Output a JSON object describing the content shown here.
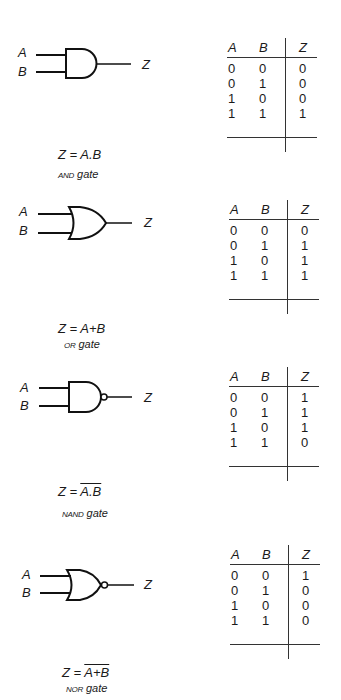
{
  "gates": [
    {
      "type": "AND",
      "inputs": [
        "A",
        "B"
      ],
      "output": "Z",
      "expression": {
        "prefix": "Z = ",
        "body": "A.B",
        "overline": false
      },
      "name": {
        "abbr": "AND",
        "suffix": "gate"
      },
      "truth_table": {
        "headers": [
          "A",
          "B",
          "Z"
        ],
        "rows": [
          [
            "0",
            "0",
            "0"
          ],
          [
            "0",
            "1",
            "0"
          ],
          [
            "1",
            "0",
            "0"
          ],
          [
            "1",
            "1",
            "1"
          ]
        ]
      }
    },
    {
      "type": "OR",
      "inputs": [
        "A",
        "B"
      ],
      "output": "Z",
      "expression": {
        "prefix": "Z = ",
        "body": "A+B",
        "overline": false
      },
      "name": {
        "abbr": "OR",
        "suffix": "gate"
      },
      "truth_table": {
        "headers": [
          "A",
          "B",
          "Z"
        ],
        "rows": [
          [
            "0",
            "0",
            "0"
          ],
          [
            "0",
            "1",
            "1"
          ],
          [
            "1",
            "0",
            "1"
          ],
          [
            "1",
            "1",
            "1"
          ]
        ]
      }
    },
    {
      "type": "NAND",
      "inputs": [
        "A",
        "B"
      ],
      "output": "Z",
      "expression": {
        "prefix": "Z = ",
        "body": "A.B",
        "overline": true
      },
      "name": {
        "abbr": "NAND",
        "suffix": "gate"
      },
      "truth_table": {
        "headers": [
          "A",
          "B",
          "Z"
        ],
        "rows": [
          [
            "0",
            "0",
            "1"
          ],
          [
            "0",
            "1",
            "1"
          ],
          [
            "1",
            "0",
            "1"
          ],
          [
            "1",
            "1",
            "0"
          ]
        ]
      }
    },
    {
      "type": "NOR",
      "inputs": [
        "A",
        "B"
      ],
      "output": "Z",
      "expression": {
        "prefix": "Z = ",
        "body": "A+B",
        "overline": true
      },
      "name": {
        "abbr": "NOR",
        "suffix": "gate"
      },
      "truth_table": {
        "headers": [
          "A",
          "B",
          "Z"
        ],
        "rows": [
          [
            "0",
            "0",
            "1"
          ],
          [
            "0",
            "1",
            "0"
          ],
          [
            "1",
            "0",
            "0"
          ],
          [
            "1",
            "1",
            "0"
          ]
        ]
      }
    }
  ]
}
